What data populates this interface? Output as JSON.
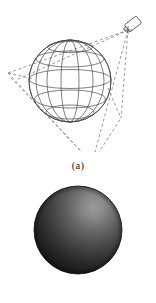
{
  "figure": {
    "background_color": "#ffffff",
    "panels": [
      {
        "id": "a",
        "caption": "(a)",
        "name": "wireframe-sphere-with-projector",
        "description": "Wireframe sphere with latitude and longitude lines, illuminated by a projector at upper right casting a dashed projection cone",
        "sphere": {
          "center_x": 70,
          "center_y": 81,
          "radius": 41,
          "longitude_lines": 8,
          "latitude_lines": 5,
          "line_color": "#4a4a4a"
        },
        "emitter": {
          "name": "projector",
          "x": 133,
          "y": 24,
          "angle_deg": -38,
          "width": 15,
          "height": 9,
          "color": "#4a4a4a"
        },
        "cone": {
          "apex_x": 128,
          "apex_y": 30,
          "dash_color": "#6e6e6e",
          "dash_pattern": "3 2.4",
          "corners": [
            {
              "x": 8,
              "y": 73
            },
            {
              "x": 92,
              "y": 163
            },
            {
              "x": 121,
              "y": 118
            }
          ]
        }
      },
      {
        "id": "b",
        "caption": "(b)",
        "name": "shaded-sphere",
        "description": "Rendered shaded sphere with diffuse highlight in the upper right quadrant falling off to dark at the lower left limb",
        "sphere": {
          "center_x": 78,
          "center_y": 230,
          "radius": 44,
          "highlight_x_pct": 68,
          "highlight_y_pct": 24,
          "highlight_color": "#8d8d8d",
          "mid_color": "#4c4c4c",
          "shadow_color": "#1e1e1e",
          "edge_color": "#111111"
        }
      }
    ]
  }
}
